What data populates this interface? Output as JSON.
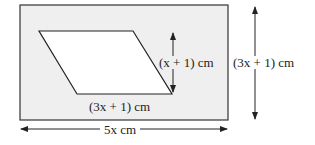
{
  "diagram": {
    "outer_rectangle": {
      "width_label": "5x cm",
      "height_label": "(3x + 1) cm",
      "fill": "#efefef",
      "stroke": "#333333"
    },
    "parallelogram": {
      "base_label": "(3x + 1) cm",
      "height_label": "(x + 1) cm",
      "fill": "#ffffff"
    },
    "labels": {
      "inner_height": "(x + 1) cm",
      "inner_base": "(3x + 1) cm",
      "outer_height": "(3x + 1) cm",
      "outer_width": "5x cm"
    }
  }
}
